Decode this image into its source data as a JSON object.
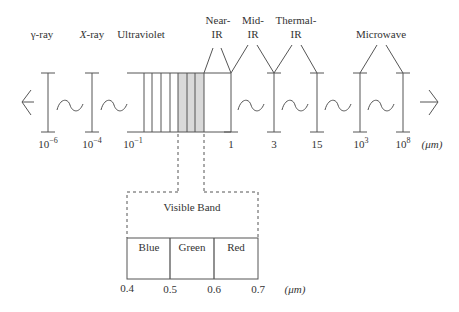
{
  "diagram": {
    "regions": [
      {
        "label": "γ-ray",
        "x": 48
      },
      {
        "label": "X-ray",
        "x": 92
      },
      {
        "label": "Ultraviolet",
        "x": 137
      },
      {
        "label_line1": "Near-",
        "label_line2": "IR",
        "x": 217
      },
      {
        "label_line1": "Mid-",
        "label_line2": "IR",
        "x": 260
      },
      {
        "label_line1": "Thermal-",
        "label_line2": "IR",
        "x": 303
      },
      {
        "label": "Microwave",
        "x": 381
      }
    ],
    "ticks": [
      {
        "label": "10",
        "sup": "−6"
      },
      {
        "label": "10",
        "sup": "−4"
      },
      {
        "label": "10",
        "sup": "−1"
      },
      {
        "label": "1"
      },
      {
        "label": "3"
      },
      {
        "label": "15"
      },
      {
        "label": "10",
        "sup": "3"
      },
      {
        "label": "10",
        "sup": "8"
      }
    ],
    "unit": "(μm)",
    "visible_band": {
      "title": "Visible Band",
      "bands": [
        "Blue",
        "Green",
        "Red"
      ],
      "ticks": [
        "0.4",
        "0.5",
        "0.6",
        "0.7"
      ],
      "unit": "(μm)",
      "shade_color": "#d9d9d9"
    },
    "line_color": "#555555"
  }
}
